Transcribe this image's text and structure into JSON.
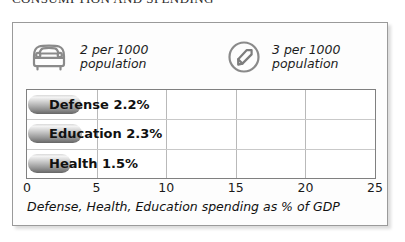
{
  "heading": "CONSUMPTION AND SPENDING",
  "legend": [
    {
      "icon": "car-icon",
      "line1": "2 per 1000",
      "line2": "population"
    },
    {
      "icon": "phone-icon",
      "line1": "3 per 1000",
      "line2": "population"
    }
  ],
  "chart_data": {
    "type": "bar",
    "orientation": "horizontal",
    "categories": [
      "Defense",
      "Education",
      "Health"
    ],
    "values": [
      2.2,
      2.3,
      1.5
    ],
    "labels": [
      "Defense 2.2%",
      "Education 2.3%",
      "Health 1.5%"
    ],
    "title": "",
    "xlabel": "Defense, Health, Education spending as % of GDP",
    "ylabel": "",
    "xlim": [
      0,
      25
    ],
    "ticks": [
      "0",
      "5",
      "10",
      "15",
      "20",
      "25"
    ],
    "grid": true,
    "legend_position": "none",
    "bar_color": "#9a9a9a"
  },
  "caption": "Defense, Health, Education spending as % of GDP",
  "colors": {
    "panel_border": "#9a9a9a",
    "grid": "#b9b9b9",
    "text": "#111111",
    "bar": "#8e8e8e"
  }
}
